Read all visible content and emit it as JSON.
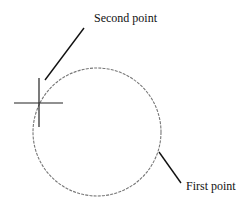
{
  "labels": {
    "second_point": "Second point",
    "first_point": "First point"
  },
  "colors": {
    "background": "#ffffff",
    "circle": "#777777",
    "lines": "#111111"
  },
  "geometry": {
    "circle": {
      "cx": 97,
      "cy": 132,
      "r": 64,
      "style": "dashed"
    },
    "crosshair": {
      "x": 39,
      "y": 103,
      "h_len": 50,
      "v_len": 50
    },
    "second_point_leader": {
      "x1": 45,
      "y1": 80,
      "x2": 84,
      "y2": 28
    },
    "first_point_leader": {
      "x1": 159,
      "y1": 152,
      "x2": 181,
      "y2": 183
    }
  }
}
